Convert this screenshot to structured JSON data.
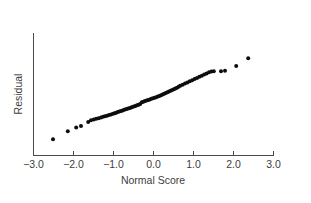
{
  "chart_data": {
    "type": "scatter",
    "title": "",
    "subtitle": "",
    "xlabel": "Normal Score",
    "ylabel": "Residual",
    "xlim": [
      -3.0,
      3.0
    ],
    "ylim": [
      -3.0,
      3.0
    ],
    "xticks": [
      -3.0,
      -2.0,
      -1.0,
      0.0,
      1.0,
      2.0,
      3.0
    ],
    "xticklabels": [
      "−3.0",
      "−2.0",
      "−1.0",
      "0.0",
      "1.0",
      "2.0",
      "3.0"
    ],
    "yticks": [],
    "yticklabels": [],
    "grid": false,
    "legend": null,
    "annotations": [],
    "marker": {
      "shape": "circle",
      "color": "#0d0d0d",
      "size": 3.1
    },
    "series": [
      {
        "name": "residual-vs-normal-score",
        "x": [
          -2.5,
          -2.13,
          -1.92,
          -1.8,
          -1.62,
          -1.55,
          -1.48,
          -1.42,
          -1.36,
          -1.3,
          -1.25,
          -1.2,
          -1.15,
          -1.1,
          -1.05,
          -1.0,
          -0.96,
          -0.92,
          -0.88,
          -0.84,
          -0.8,
          -0.76,
          -0.72,
          -0.68,
          -0.64,
          -0.6,
          -0.56,
          -0.52,
          -0.48,
          -0.44,
          -0.4,
          -0.36,
          -0.32,
          -0.28,
          -0.24,
          -0.2,
          -0.16,
          -0.12,
          -0.08,
          -0.04,
          0.0,
          0.04,
          0.08,
          0.12,
          0.16,
          0.2,
          0.24,
          0.28,
          0.32,
          0.36,
          0.4,
          0.44,
          0.48,
          0.52,
          0.56,
          0.6,
          0.64,
          0.68,
          0.74,
          0.8,
          0.86,
          0.92,
          0.98,
          1.04,
          1.1,
          1.16,
          1.22,
          1.28,
          1.34,
          1.4,
          1.46,
          1.52,
          1.7,
          1.8,
          2.08,
          2.38
        ],
        "y": [
          -2.42,
          -2.0,
          -1.8,
          -1.72,
          -1.5,
          -1.4,
          -1.36,
          -1.33,
          -1.3,
          -1.26,
          -1.22,
          -1.19,
          -1.16,
          -1.13,
          -1.1,
          -1.06,
          -1.03,
          -1.0,
          -0.97,
          -0.94,
          -0.91,
          -0.88,
          -0.85,
          -0.82,
          -0.79,
          -0.76,
          -0.73,
          -0.7,
          -0.67,
          -0.64,
          -0.6,
          -0.57,
          -0.54,
          -0.44,
          -0.41,
          -0.38,
          -0.35,
          -0.32,
          -0.29,
          -0.26,
          -0.23,
          -0.2,
          -0.17,
          -0.14,
          -0.11,
          -0.07,
          -0.03,
          0.01,
          0.05,
          0.09,
          0.13,
          0.17,
          0.21,
          0.25,
          0.29,
          0.34,
          0.39,
          0.44,
          0.5,
          0.56,
          0.62,
          0.68,
          0.74,
          0.8,
          0.86,
          0.92,
          0.98,
          1.04,
          1.1,
          1.16,
          1.2,
          1.22,
          1.22,
          1.24,
          1.5,
          1.92
        ]
      }
    ]
  }
}
